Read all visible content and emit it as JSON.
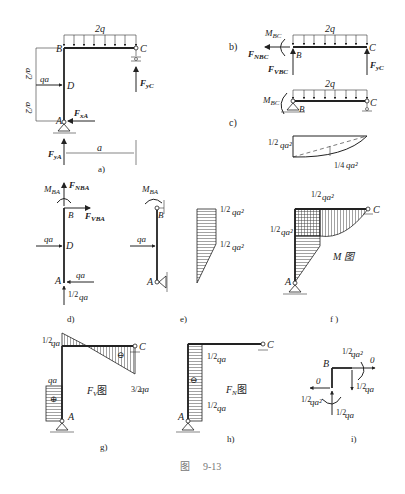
{
  "figure": {
    "caption_prefix": "图",
    "caption_number": "9-13"
  },
  "panels": {
    "a": {
      "label": "a)",
      "load": "2q",
      "node_B": "B",
      "node_C": "C",
      "node_D": "D",
      "node_A": "A",
      "point_load": "qa",
      "dim_upper": "a/2",
      "dim_lower": "a/2",
      "dim_span": "a",
      "react_xA": "F",
      "react_xA_sub": "xA",
      "react_yA": "F",
      "react_yA_sub": "yA",
      "react_yC": "F",
      "react_yC_sub": "yC"
    },
    "b": {
      "label": "b)",
      "load": "2q",
      "moment": "M",
      "moment_sub": "BC",
      "normal": "F",
      "normal_sub": "NBC",
      "shear": "F",
      "shear_sub": "VBC",
      "node_B": "B",
      "node_C": "C",
      "react_yC": "F",
      "react_yC_sub": "yC"
    },
    "c": {
      "label": "c)",
      "load": "2q",
      "moment": "M",
      "moment_sub": "BC",
      "node_B": "B",
      "node_C": "C",
      "val_left": "qa²",
      "val_left_frac": "1/2",
      "val_mid": "qa²",
      "val_mid_frac": "1/4"
    },
    "d": {
      "label": "d)",
      "moment": "M",
      "moment_sub": "BA",
      "normal": "F",
      "normal_sub": "NBA",
      "shear": "F",
      "shear_sub": "VBA",
      "node_B": "B",
      "node_D": "D",
      "node_A": "A",
      "load_D": "qa",
      "load_A": "qa",
      "react_A": "qa",
      "react_A_frac": "1/2"
    },
    "e": {
      "label": "e)",
      "moment": "M",
      "moment_sub": "BA",
      "node_B": "B",
      "node_A": "A",
      "load": "qa",
      "val_top": "qa²",
      "val_top_frac": "1/2",
      "val_mid": "qa²",
      "val_mid_frac": "1/2"
    },
    "f": {
      "label": "f )",
      "val_top": "qa²",
      "val_top_frac": "1/2",
      "val_left": "qa²",
      "val_left_frac": "1/2",
      "node_C": "C",
      "node_A": "A",
      "title": "M 图"
    },
    "g": {
      "label": "g)",
      "val_top": "qa",
      "val_top_frac": "1/2",
      "val_right": "qa",
      "val_right_frac": "3/2",
      "val_left": "qa",
      "sign_beam": "⊖",
      "sign_col": "⊕",
      "node_C": "C",
      "node_A": "A",
      "title_main": "F",
      "title_sub": "V",
      "title_suffix": "图"
    },
    "h": {
      "label": "h)",
      "val_top": "qa",
      "val_top_frac": "1/2",
      "val_bot": "qa",
      "val_bot_frac": "1/2",
      "sign": "⊖",
      "node_C": "C",
      "node_A": "A",
      "title_main": "F",
      "title_sub": "N",
      "title_suffix": "图"
    },
    "i": {
      "label": "i)",
      "node_B": "B",
      "moment_top": "qa²",
      "moment_top_frac": "1/2",
      "moment_bot": "qa²",
      "moment_bot_frac": "1/2",
      "right_axial": "0",
      "left_axial": "0",
      "beam_shear": "qa",
      "beam_shear_frac": "1/2",
      "col_axial": "qa",
      "col_axial_frac": "1/2"
    }
  }
}
